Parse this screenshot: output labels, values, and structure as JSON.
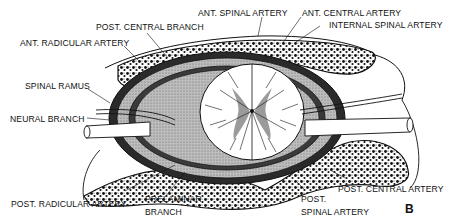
{
  "figure": {
    "panel_letter": "B",
    "colors": {
      "ink": "#111111",
      "paper": "#ffffff",
      "shading": "#8a8a8a"
    },
    "labels": {
      "ant_spinal_artery": "ANT. SPINAL ARTERY",
      "ant_central_artery": "ANT. CENTRAL ARTERY",
      "post_central_branch": "POST. CENTRAL BRANCH",
      "internal_spinal_artery": "INTERNAL SPINAL ARTERY",
      "ant_radicular_artery": "ANT. RADICULAR ARTERY",
      "spinal_ramus": "SPINAL RAMUS",
      "neural_branch": "NEURAL BRANCH",
      "post_radicular_artery": "POST. RADICULAR ARTERY",
      "prelaminar_branch_1": "PRELAMINAR",
      "prelaminar_branch_2": "BRANCH",
      "post_spinal_artery_1": "POST.",
      "post_spinal_artery_2": "SPINAL ARTERY",
      "post_central_artery": "POST. CENTRAL ARTERY"
    }
  }
}
